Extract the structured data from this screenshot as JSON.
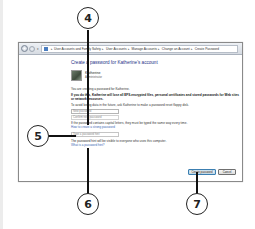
{
  "window": {
    "breadcrumbs": [
      "User Accounts and Family Safety",
      "User Accounts",
      "Manage Accounts",
      "Change an Account",
      "Create Password"
    ],
    "heading": "Create a password for Katherine's account",
    "user": {
      "name": "Katherine",
      "role": "Administrator"
    },
    "info_text": "You are creating a password for Katherine.",
    "warning_text": "If you do this, Katherine will lose all EFS-encrypted files, personal certificates and stored passwords for Web sites or network resources.",
    "advice_text": "To avoid losing data in the future, ask Katherine to make a password reset floppy disk.",
    "new_password_placeholder": "New password",
    "confirm_password_placeholder": "Confirm new password",
    "caps_note": "If the password contains capital letters, they must be typed the same way every time.",
    "strong_password_link": "How to create a strong password",
    "hint_placeholder": "Type a password hint",
    "hint_note": "The password hint will be visible to everyone who uses this computer.",
    "hint_example_link": "What is a password hint?",
    "buttons": {
      "create": "Create password",
      "cancel": "Cancel"
    }
  },
  "callouts": [
    "4",
    "5",
    "6",
    "7"
  ]
}
